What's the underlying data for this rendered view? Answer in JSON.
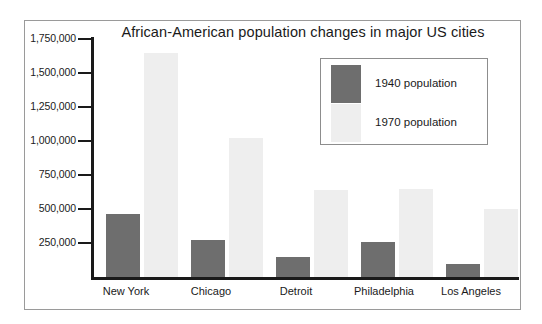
{
  "chart_data": {
    "type": "bar",
    "title": "African-American population changes in major US cities",
    "xlabel": "",
    "ylabel": "",
    "categories": [
      "New York",
      "Chicago",
      "Detroit",
      "Philadelphia",
      "Los Angeles"
    ],
    "series": [
      {
        "name": "1940 population",
        "color": "#6e6e6e",
        "values": [
          465000,
          275000,
          150000,
          255000,
          95000
        ]
      },
      {
        "name": "1970 population",
        "color": "#eeeeee",
        "values": [
          1645000,
          1020000,
          640000,
          645000,
          500000
        ]
      }
    ],
    "legend": [
      "1940 population",
      "1970 population"
    ],
    "legend_position": "top-right-inside",
    "grid": false,
    "ylim": [
      0,
      1800000
    ],
    "ytick_values": [
      1750000,
      1500000,
      1250000,
      1000000,
      750000,
      500000,
      250000
    ],
    "ytick_labels": [
      "1,750,000",
      "1,500,000",
      "1,250,000",
      "1,000,000",
      "750,000",
      "500,000",
      "250,000"
    ]
  },
  "colors": {
    "series_1940": "#6e6e6e",
    "series_1970": "#eeeeee",
    "axis": "#1a1a1a",
    "frame": "#9a9a9a",
    "background": "#ffffff"
  }
}
